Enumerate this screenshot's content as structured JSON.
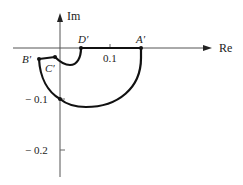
{
  "diagram": {
    "type": "nyquist-plot",
    "axes": {
      "real_label": "Re",
      "imag_label": "Im",
      "real_tick_label": "0.1",
      "imag_tick_labels": [
        "− 0.1",
        "− 0.2"
      ]
    },
    "points": {
      "A": "A′",
      "B": "B′",
      "C": "C′",
      "D": "D′"
    },
    "colors": {
      "axis": "#555555",
      "curve": "#111111",
      "text": "#222222"
    }
  }
}
